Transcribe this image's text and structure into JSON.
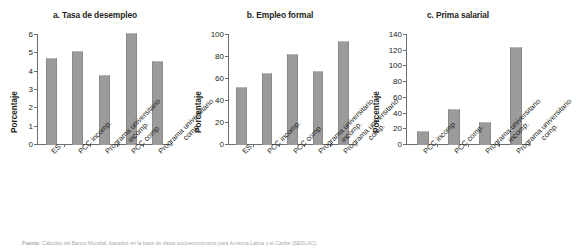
{
  "figure": {
    "footer_label": "Fuente:",
    "footer_text": " Cálculos del Banco Mundial, basados en la base de datos socioeconómicos para América Latina y el Caribe (SEDLAC).",
    "bar_color": "#9b9b9b",
    "axis_color": "#6d6e71",
    "text_color": "#231f20"
  },
  "chart_data": [
    {
      "type": "bar",
      "title": "a. Tasa de desempleo",
      "xlabel": "",
      "ylabel": "Porcentaje",
      "ylim": [
        0,
        6
      ],
      "yticks": [
        0,
        1,
        2,
        3,
        4,
        5,
        6
      ],
      "ytick_labels": [
        "0",
        "1",
        "2",
        "3",
        "4",
        "5",
        "6"
      ],
      "grid": false,
      "legend": "none",
      "categories": [
        "ES",
        "PCC incomp.",
        "Programa universitario incomp.",
        "PCC comp.",
        "Programa universitario comp."
      ],
      "category_lines": [
        [
          "ES"
        ],
        [
          "PCC incomp."
        ],
        [
          "Programa universitario",
          "incomp."
        ],
        [
          "PCC comp."
        ],
        [
          "Programa universitario",
          "comp."
        ]
      ],
      "values": [
        4.7,
        5.05,
        3.75,
        6.05,
        4.55
      ]
    },
    {
      "type": "bar",
      "title": "b. Empleo formal",
      "xlabel": "",
      "ylabel": "Porcentaje",
      "ylim": [
        0,
        100
      ],
      "yticks": [
        0,
        20,
        40,
        60,
        80,
        100
      ],
      "ytick_labels": [
        "0",
        "20",
        "40",
        "60",
        "80",
        "100"
      ],
      "grid": false,
      "legend": "none",
      "categories": [
        "ES",
        "PCC incomp.",
        "PCC comp.",
        "Programa universitario incomp.",
        "Programa universitario comp."
      ],
      "category_lines": [
        [
          "ES"
        ],
        [
          "PCC incomp."
        ],
        [
          "PCC comp."
        ],
        [
          "Programa universitario",
          "incomp."
        ],
        [
          "Programa universitario",
          "comp."
        ]
      ],
      "values": [
        52,
        65,
        82,
        66.5,
        94
      ]
    },
    {
      "type": "bar",
      "title": "c. Prima salarial",
      "xlabel": "",
      "ylabel": "Porcentaje",
      "ylim": [
        0,
        140
      ],
      "yticks": [
        0,
        20,
        40,
        60,
        80,
        100,
        120,
        140
      ],
      "ytick_labels": [
        "0",
        "20",
        "40",
        "60",
        "80",
        "100",
        "120",
        "140"
      ],
      "grid": false,
      "legend": "none",
      "categories": [
        "PCC incomp.",
        "PCC comp.",
        "Programa universitario incomp.",
        "Programa universitario comp."
      ],
      "category_lines": [
        [
          "PCC incomp."
        ],
        [
          "PCC comp."
        ],
        [
          "Programa universitario",
          "incomp."
        ],
        [
          "Programa universitario",
          "comp."
        ]
      ],
      "values": [
        17,
        45,
        28,
        123
      ]
    }
  ]
}
